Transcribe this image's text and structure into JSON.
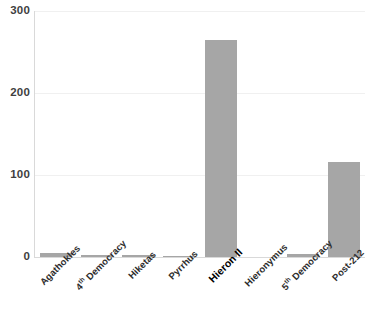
{
  "chart_data": {
    "type": "bar",
    "title": "",
    "subtitle": "",
    "xlabel": "",
    "ylabel": "",
    "categories": [
      "Agathokles",
      "4th Democracy",
      "Hiketas",
      "Pyrrhus",
      "Hieron II",
      "Hieronymus",
      "5th Democracy",
      "Post-212"
    ],
    "category_labels_html": [
      "Agathokles",
      "4<sup>th</sup> Democracy",
      "Hiketas",
      "Pyrrhus",
      "Hieron II",
      "Hieronymus",
      "5<sup>th</sup> Democracy",
      "Post-212"
    ],
    "emphasized_categories": [
      "Hieron II"
    ],
    "values": [
      5,
      2,
      3,
      1,
      265,
      0,
      4,
      116
    ],
    "ylim": [
      0,
      300
    ],
    "yticks": [
      0,
      100,
      200,
      300
    ],
    "ytick_labels": [
      "0",
      "100",
      "200",
      "300"
    ],
    "grid": true,
    "grid_axis": "y",
    "legend": false,
    "legend_position": "none",
    "bar_color": "#a6a6a6",
    "gridline_color": "#f0f0f0",
    "axis_color": "#d9d9d9",
    "tick_label_color": "#3f3f3f",
    "category_label_color": "#2d2d2d",
    "background_color": "#ffffff"
  }
}
